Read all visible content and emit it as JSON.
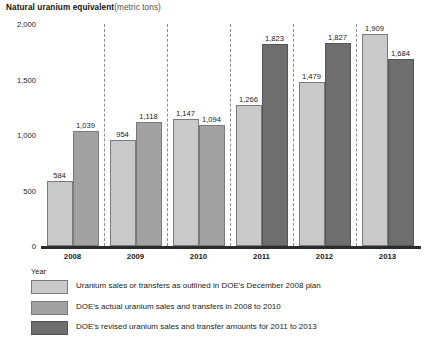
{
  "chart_data": {
    "type": "bar",
    "title_main": "Natural uranium equivalent",
    "title_unit": "(metric tons)",
    "xlabel": "Year",
    "ylabel": "",
    "ylim": [
      0,
      2000
    ],
    "yticks": [
      "0",
      "500",
      "1,000",
      "1,500",
      "2,000"
    ],
    "ytick_values": [
      0,
      500,
      1000,
      1500,
      2000
    ],
    "grid": false,
    "group_dividers": true,
    "legend_position": "bottom",
    "categories": [
      "2008",
      "2009",
      "2010",
      "2011",
      "2012",
      "2013"
    ],
    "series": [
      {
        "name": "Uranium sales or transfers as outlined in DOE's December 2008 plan",
        "key": "plan",
        "color": "#c9c9c9",
        "values": [
          584,
          954,
          1147,
          1266,
          1479,
          1909
        ],
        "labels": [
          "584",
          "954",
          "1,147",
          "1,266",
          "1,479",
          "1,909"
        ]
      },
      {
        "name": "DOE's actual uranium sales and transfers in 2008 to 2010",
        "key": "actual",
        "color": "#a2a2a2",
        "values": [
          1039,
          1118,
          1094,
          null,
          null,
          null
        ],
        "labels": [
          "1,039",
          "1,118",
          "1,094",
          "",
          "",
          ""
        ]
      },
      {
        "name": "DOE's revised uranium sales and transfer amounts for 2011 to 2013",
        "key": "revised",
        "color": "#6e6e6e",
        "values": [
          null,
          null,
          null,
          1823,
          1827,
          1684
        ],
        "labels": [
          "",
          "",
          "",
          "1,823",
          "1,827",
          "1,684"
        ]
      }
    ]
  },
  "legend": {
    "items": [
      {
        "label": "Uranium sales or transfers as outlined in DOE's December 2008 plan",
        "color": "#c9c9c9"
      },
      {
        "label": "DOE's actual uranium sales and transfers in 2008 to 2010",
        "color": "#a2a2a2"
      },
      {
        "label": "DOE's revised uranium sales and transfer amounts for 2011 to 2013",
        "color": "#6e6e6e"
      }
    ]
  }
}
